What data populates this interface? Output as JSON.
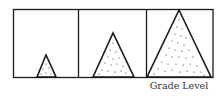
{
  "diagram": {
    "type": "three-panel triangle growth illustration",
    "panels": [
      {
        "index": 1,
        "triangle_size": "small"
      },
      {
        "index": 2,
        "triangle_size": "medium"
      },
      {
        "index": 3,
        "triangle_size": "large"
      }
    ],
    "axis_label": "Grade Level",
    "colors": {
      "line": "#1a1a1a",
      "dots": "#2a2a2a",
      "background": "#ffffff",
      "label": "#333333"
    }
  }
}
